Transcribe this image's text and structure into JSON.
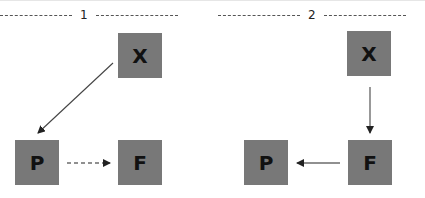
{
  "panels": [
    {
      "label": "1",
      "nodes": {
        "x": "X",
        "p": "P",
        "f": "F"
      },
      "edges": [
        {
          "from": "X",
          "to": "P",
          "style": "solid"
        },
        {
          "from": "P",
          "to": "F",
          "style": "dashed"
        }
      ]
    },
    {
      "label": "2",
      "nodes": {
        "x": "X",
        "f": "F",
        "p": "P"
      },
      "edges": [
        {
          "from": "X",
          "to": "F",
          "style": "solid"
        },
        {
          "from": "F",
          "to": "P",
          "style": "solid"
        }
      ]
    }
  ],
  "colors": {
    "box": "#787878",
    "text": "#111111",
    "arrow": "#333333"
  }
}
